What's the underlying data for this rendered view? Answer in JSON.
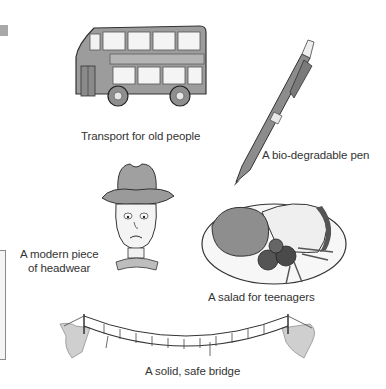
{
  "illustrations": [
    {
      "id": "bus",
      "icon": "double-decker-bus-icon",
      "caption": "Transport for old people"
    },
    {
      "id": "pen",
      "icon": "ballpoint-pen-icon",
      "caption": "A bio-degradable pen"
    },
    {
      "id": "hat",
      "icon": "cowboy-hat-man-icon",
      "caption_line1": "A modern piece",
      "caption_line2": "of headwear"
    },
    {
      "id": "salad",
      "icon": "plate-of-food-icon",
      "caption": "A salad for teenagers"
    },
    {
      "id": "bridge",
      "icon": "rope-bridge-icon",
      "caption": "A solid, safe bridge"
    }
  ],
  "colors": {
    "ink": "#2a2a2a",
    "fill_gray": "#9a9a9a",
    "light_gray": "#d6d6d6",
    "side_tab": "#a8a8a8"
  }
}
